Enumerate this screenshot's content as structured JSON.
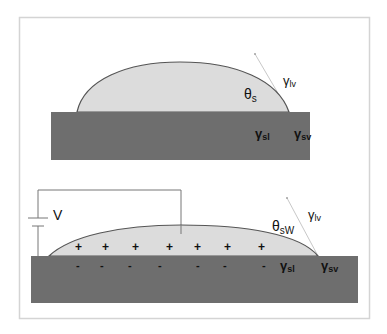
{
  "colors": {
    "background": "#ffffff",
    "frame": "#d4d4d4",
    "substrate": "#6e6e6e",
    "droplet_fill": "#dcdcdc",
    "droplet_outline": "#555555",
    "wire": "#777777",
    "tension_line": "#c8c8c8",
    "text": "#111111"
  },
  "top_panel": {
    "name": "no-voltage",
    "angle_label": {
      "symbol": "θ",
      "sub": "s"
    },
    "gamma_lv": {
      "symbol": "γ",
      "sub": "lv"
    },
    "gamma_sl": {
      "symbol": "γ",
      "sub": "sl"
    },
    "gamma_sv": {
      "symbol": "γ",
      "sub": "sv"
    }
  },
  "bottom_panel": {
    "name": "with-voltage",
    "voltage_label": "V",
    "angle_label": {
      "symbol": "θ",
      "sub": "sW"
    },
    "gamma_lv": {
      "symbol": "γ",
      "sub": "lv"
    },
    "gamma_sl": {
      "symbol": "γ",
      "sub": "sl"
    },
    "gamma_sv": {
      "symbol": "γ",
      "sub": "sv"
    },
    "positive_charge": "+",
    "negative_charge": "-",
    "positive_charges_count": 7,
    "negative_charges_count": 7
  }
}
